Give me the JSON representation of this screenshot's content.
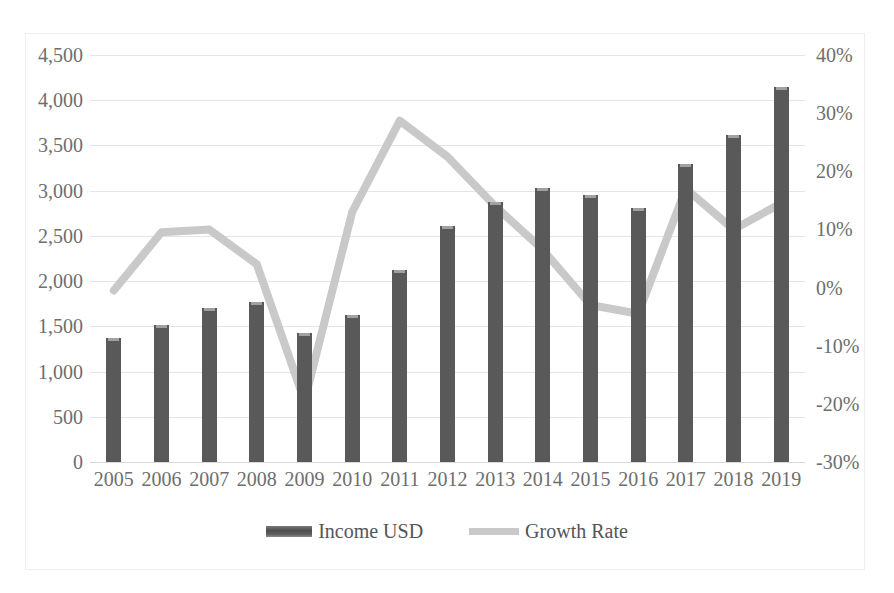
{
  "chart_data": {
    "type": "bar",
    "title": "",
    "subtitle": "",
    "xlabel": "",
    "ylabel": "",
    "categories": [
      "2005",
      "2006",
      "2007",
      "2008",
      "2009",
      "2010",
      "2011",
      "2012",
      "2013",
      "2014",
      "2015",
      "2016",
      "2017",
      "2018",
      "2019"
    ],
    "series": [
      {
        "name": "Income USD",
        "type": "bar",
        "axis": "left",
        "color": "#595959",
        "values": [
          1370,
          1520,
          1700,
          1770,
          1430,
          1620,
          2120,
          2610,
          2880,
          3030,
          2950,
          2810,
          3300,
          3620,
          4150
        ]
      },
      {
        "name": "Growth Rate",
        "type": "line",
        "axis": "right",
        "color": "#c9c9c9",
        "values": [
          -0.5,
          9.5,
          10.0,
          4.0,
          -19.5,
          13.0,
          28.7,
          22.5,
          14.0,
          6.5,
          -3.0,
          -4.5,
          17.0,
          10.0,
          14.5
        ]
      }
    ],
    "left_axis": {
      "min": 0,
      "max": 4500,
      "step": 500,
      "ticks": [
        "0",
        "500",
        "1,000",
        "1,500",
        "2,000",
        "2,500",
        "3,000",
        "3,500",
        "4,000",
        "4,500"
      ]
    },
    "right_axis": {
      "min": -30,
      "max": 40,
      "step": 10,
      "ticks": [
        "-30%",
        "-20%",
        "-10%",
        "0%",
        "10%",
        "20%",
        "30%",
        "40%"
      ]
    },
    "grid": true,
    "legend_position": "bottom",
    "legend": [
      {
        "label": "Income USD",
        "swatch": "bar-swatch",
        "color": "#595959"
      },
      {
        "label": "Growth Rate",
        "swatch": "line-swatch",
        "color": "#c9c9c9"
      }
    ]
  }
}
